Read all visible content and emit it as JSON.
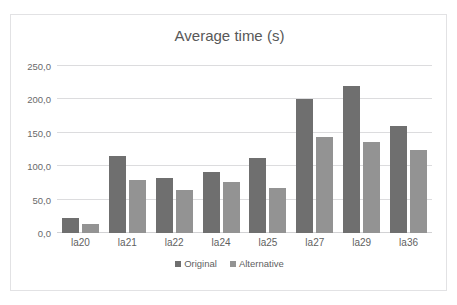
{
  "chart_data": {
    "type": "bar",
    "title": "Average time (s)",
    "xlabel": "",
    "ylabel": "",
    "categories": [
      "la20",
      "la21",
      "la22",
      "la24",
      "la25",
      "la27",
      "la29",
      "la36"
    ],
    "series": [
      {
        "name": "Original",
        "color": "#6f6f6f",
        "values": [
          23,
          115,
          82,
          92,
          113,
          201,
          220,
          160
        ]
      },
      {
        "name": "Alternative",
        "color": "#939393",
        "values": [
          14,
          80,
          65,
          77,
          67,
          144,
          136,
          125
        ]
      }
    ],
    "ylim": [
      0,
      250
    ],
    "ytick_labels": [
      "0,0",
      "50,0",
      "100,0",
      "150,0",
      "200,0",
      "250,0"
    ],
    "ytick_values": [
      0,
      50,
      100,
      150,
      200,
      250
    ],
    "grid": true,
    "legend_position": "bottom"
  },
  "legend": {
    "original_label": "Original",
    "alternative_label": "Alternative"
  },
  "artifacts": {
    "top_cropped_text": ""
  }
}
